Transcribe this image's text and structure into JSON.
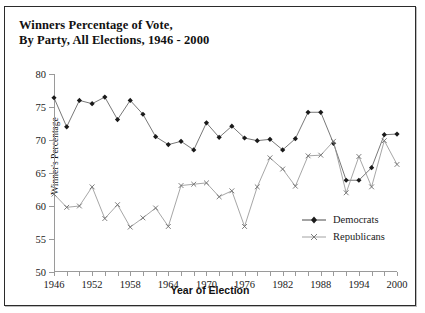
{
  "chart_data": {
    "type": "line",
    "title": "Winners Percentage of Vote, By Party, All Elections, 1946 - 2000",
    "title_line1": "Winners Percentage of Vote,",
    "title_line2": "By Party, All Elections, 1946 - 2000",
    "xlabel": "Year of Election",
    "ylabel": "Winner's Percentage",
    "ylim": [
      50,
      80
    ],
    "yticks": [
      50,
      55,
      60,
      65,
      70,
      75,
      80
    ],
    "xlim": [
      1946,
      2000
    ],
    "xticks": [
      1946,
      1948,
      1950,
      1952,
      1954,
      1956,
      1958,
      1960,
      1962,
      1964,
      1966,
      1968,
      1970,
      1972,
      1974,
      1976,
      1978,
      1980,
      1982,
      1984,
      1986,
      1988,
      1990,
      1992,
      1994,
      1996,
      1998,
      2000
    ],
    "xticklabels": [
      1946,
      1952,
      1958,
      1964,
      1970,
      1976,
      1982,
      1988,
      1994,
      2000
    ],
    "grid": false,
    "legend_position": "lower right",
    "x": [
      1946,
      1948,
      1950,
      1952,
      1954,
      1956,
      1958,
      1960,
      1962,
      1964,
      1966,
      1968,
      1970,
      1972,
      1974,
      1976,
      1978,
      1980,
      1982,
      1984,
      1986,
      1988,
      1990,
      1992,
      1994,
      1996,
      1998,
      2000
    ],
    "series": [
      {
        "name": "Democrats",
        "marker": "diamond",
        "color": "#1a1a1a",
        "values": [
          76.4,
          72.0,
          76.0,
          75.5,
          76.5,
          73.1,
          76.0,
          73.9,
          70.5,
          69.3,
          69.8,
          68.5,
          72.6,
          70.4,
          72.1,
          70.3,
          69.9,
          70.1,
          68.5,
          70.2,
          74.2,
          74.2,
          69.5,
          63.9,
          63.9,
          65.8,
          70.8,
          70.9
        ]
      },
      {
        "name": "Republicans",
        "marker": "x",
        "color": "#6e6e6e",
        "values": [
          61.8,
          59.8,
          60.0,
          62.9,
          58.1,
          60.2,
          56.8,
          58.2,
          59.7,
          56.9,
          63.1,
          63.3,
          63.5,
          61.4,
          62.3,
          56.9,
          62.9,
          67.3,
          65.6,
          63.0,
          67.6,
          67.7,
          69.8,
          62.0,
          67.5,
          62.9,
          69.9,
          66.3
        ]
      }
    ]
  },
  "legend": {
    "items": [
      {
        "label": "Democrats"
      },
      {
        "label": "Republicans"
      }
    ]
  }
}
